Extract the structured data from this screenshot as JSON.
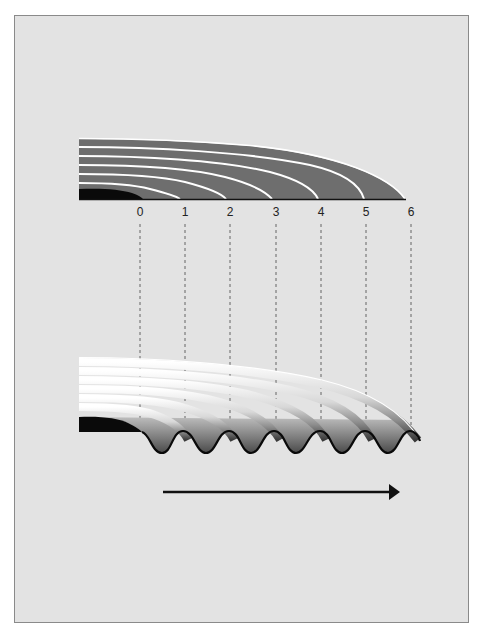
{
  "figure": {
    "background": "#e3e3e3",
    "top_diagram": {
      "description": "Layered flat bands over base line (static state)",
      "band_color": "#6e6e6e",
      "separator_color": "#ffffff",
      "core_color": "#0a0a0a",
      "band_count": 6
    },
    "scale": {
      "labels": [
        "0",
        "1",
        "2",
        "3",
        "4",
        "5",
        "6"
      ]
    },
    "bottom_diagram": {
      "description": "Layered shaded bands bending into wave pattern",
      "wave_count": 6
    },
    "arrow": {
      "direction": "right",
      "color": "#111111"
    }
  }
}
